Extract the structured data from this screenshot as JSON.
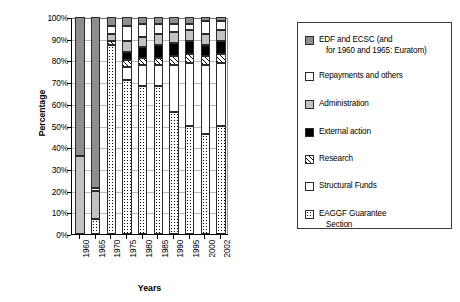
{
  "chart_data": {
    "type": "bar",
    "title": "",
    "xlabel": "Years",
    "ylabel": "Percentage",
    "ylim": [
      0,
      100
    ],
    "ytick_labels": [
      "0%",
      "10%",
      "20%",
      "30%",
      "40%",
      "50%",
      "60%",
      "70%",
      "80%",
      "90%",
      "100%"
    ],
    "ytick_values": [
      0,
      10,
      20,
      30,
      40,
      50,
      60,
      70,
      80,
      90,
      100
    ],
    "grid": true,
    "stacked": true,
    "stack_total": 100,
    "legend_position": "right",
    "categories": [
      "1960",
      "1965",
      "1970",
      "1975",
      "1980",
      "1985",
      "1990",
      "1995",
      "2000",
      "2002"
    ],
    "series": [
      {
        "name": "EAGGF Guarantee Section",
        "fill": "dotted",
        "values": [
          0,
          7,
          87,
          71,
          68,
          68,
          56,
          50,
          46,
          50
        ]
      },
      {
        "name": "Structural Funds",
        "fill": "white",
        "values": [
          0,
          0,
          0,
          6,
          10,
          10,
          22,
          29,
          32,
          29
        ]
      },
      {
        "name": "Research",
        "fill": "hatched",
        "values": [
          0,
          0,
          2,
          3,
          3,
          3,
          4,
          4,
          4,
          4
        ]
      },
      {
        "name": "External action",
        "fill": "black",
        "values": [
          0,
          0,
          0,
          4,
          5,
          6,
          6,
          6,
          5,
          6
        ]
      },
      {
        "name": "Administration",
        "fill": "light-gray",
        "values": [
          36,
          13,
          3,
          5,
          5,
          5,
          5,
          5,
          5,
          5
        ]
      },
      {
        "name": "Repayments and others",
        "fill": "white",
        "values": [
          0,
          1,
          4,
          7,
          6,
          5,
          4,
          3,
          6,
          4
        ]
      },
      {
        "name": "EDF and ECSC",
        "fill": "dark-gray",
        "values": [
          64,
          79,
          4,
          4,
          3,
          3,
          3,
          3,
          2,
          2
        ]
      }
    ]
  },
  "legend": {
    "items": [
      {
        "label_line1": "EDF and ECSC (and",
        "label_line2": "for 1960 and 1965: Euratom)",
        "fill": "dark-gray"
      },
      {
        "label_line1": "Repayments and others",
        "label_line2": "",
        "fill": "white"
      },
      {
        "label_line1": "Administration",
        "label_line2": "",
        "fill": "light-gray"
      },
      {
        "label_line1": "External action",
        "label_line2": "",
        "fill": "black"
      },
      {
        "label_line1": "Research",
        "label_line2": "",
        "fill": "hatched"
      },
      {
        "label_line1": "Structural Funds",
        "label_line2": "",
        "fill": "white"
      },
      {
        "label_line1": "EAGGF Guarantee",
        "label_line2": "Section",
        "fill": "dotted"
      }
    ]
  },
  "colors": {
    "dark_gray": "#8e8e8e",
    "light_gray": "#c2c2c2",
    "black": "#000000",
    "white": "#ffffff",
    "gridline": "#b9b9b9",
    "axis": "#000000"
  }
}
